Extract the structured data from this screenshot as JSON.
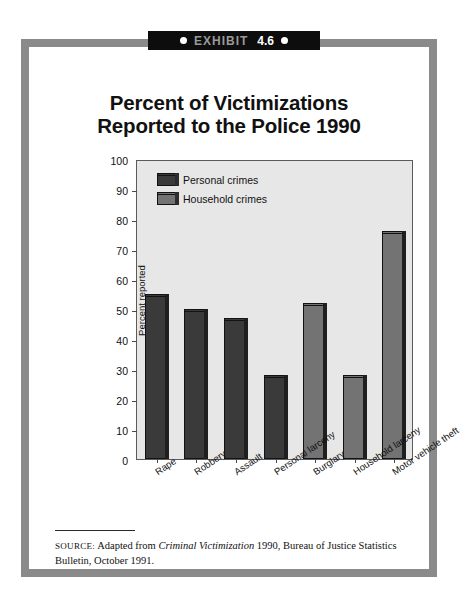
{
  "exhibit": {
    "label": "EXHIBIT",
    "number": "4.6"
  },
  "title": {
    "line1": "Percent of Victimizations",
    "line2": "Reported to the Police 1990"
  },
  "source": {
    "prefix": "SOURCE:",
    "text_before_italic": " Adapted from ",
    "italic": "Criminal Victimization",
    "text_after_italic": " 1990, Bureau of Justice Statistics Bulletin, October 1991."
  },
  "colors": {
    "personal_crimes": "#3a3a3a",
    "household_crimes": "#737373",
    "frame": "#8a8a8a",
    "plot_background": "#e7e7e7",
    "banner_background": "#0d0d0d"
  },
  "chart_data": {
    "type": "bar",
    "title": "Percent of Victimizations Reported to the Police 1990",
    "xlabel": "",
    "ylabel": "Percent reported",
    "ylim": [
      0,
      100
    ],
    "yticks": [
      0,
      10,
      20,
      30,
      40,
      50,
      60,
      70,
      80,
      90,
      100
    ],
    "grid": false,
    "legend_position": "top-left",
    "legend": [
      "Personal crimes",
      "Household crimes"
    ],
    "categories": [
      "Rape",
      "Robbery",
      "Assault",
      "Personal larceny",
      "Burglary",
      "Household larceny",
      "Motor vehicle theft"
    ],
    "group_of_category": [
      "Personal crimes",
      "Personal crimes",
      "Personal crimes",
      "Personal crimes",
      "Household crimes",
      "Household crimes",
      "Household crimes"
    ],
    "values": [
      55,
      50,
      47,
      28,
      52,
      28,
      76
    ]
  }
}
